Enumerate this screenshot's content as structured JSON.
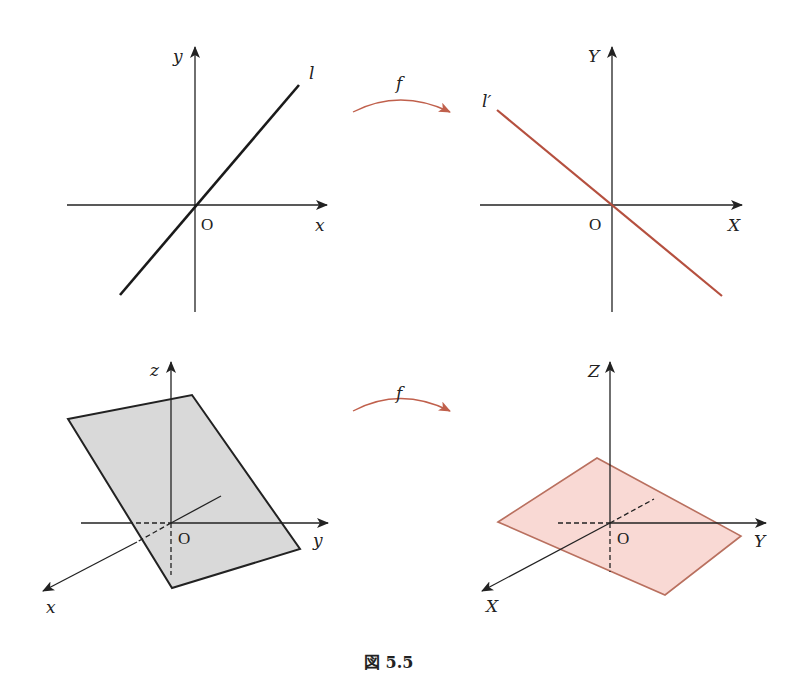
{
  "figure": {
    "caption": "図 5.5",
    "colors": {
      "axis": "#222222",
      "original_line": "#1a1a1a",
      "image_line": "#b5503f",
      "mapping_arrow": "#c0604c",
      "gray_plane_fill": "#d9d9d9",
      "gray_plane_stroke": "#222222",
      "pink_plane_fill": "#f9d9d4",
      "pink_plane_stroke": "#b9705f"
    },
    "top_row": {
      "left_panel": {
        "axis_x_label": "x",
        "axis_y_label": "y",
        "origin_label": "O",
        "line_label": "l",
        "description": "line l through origin with positive slope"
      },
      "mapping": {
        "label": "f"
      },
      "right_panel": {
        "axis_x_label": "X",
        "axis_y_label": "Y",
        "origin_label": "O",
        "line_label": "l′",
        "description": "image line l′ through origin with negative slope"
      }
    },
    "bottom_row": {
      "left_panel": {
        "axis_x_label": "x",
        "axis_y_label": "y",
        "axis_z_label": "z",
        "origin_label": "O",
        "description": "tilted gray plane through origin in xyz-space"
      },
      "mapping": {
        "label": "f"
      },
      "right_panel": {
        "axis_x_label": "X",
        "axis_y_label": "Y",
        "axis_z_label": "Z",
        "origin_label": "O",
        "description": "image plane (pink) through origin in XYZ-space"
      }
    }
  }
}
